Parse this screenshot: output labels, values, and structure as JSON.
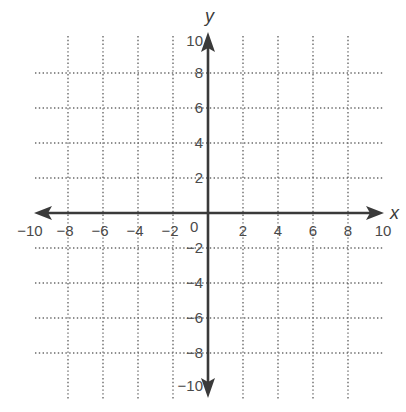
{
  "figure": {
    "type": "coordinate-plane",
    "x_axis_label": "x",
    "y_axis_label": "y",
    "x_range": [
      -10,
      10
    ],
    "y_range": [
      -10,
      10
    ],
    "grid_step": 2,
    "grid_style": "dotted",
    "origin_label": "0",
    "x_tick_labels": [
      "−10",
      "−8",
      "−6",
      "−4",
      "−2",
      "2",
      "4",
      "6",
      "8",
      "10"
    ],
    "x_tick_values": [
      -10,
      -8,
      -6,
      -4,
      -2,
      2,
      4,
      6,
      8,
      10
    ],
    "y_tick_labels": [
      "10",
      "8",
      "6",
      "4",
      "2",
      "−2",
      "−4",
      "−6",
      "−8",
      "−10"
    ],
    "y_tick_values": [
      10,
      8,
      6,
      4,
      2,
      -2,
      -4,
      -6,
      -8,
      -10
    ],
    "colors": {
      "axis": "#3a3a3a",
      "grid": "#6a6a6a",
      "label": "#4a4a4a",
      "background": "#ffffff"
    }
  }
}
